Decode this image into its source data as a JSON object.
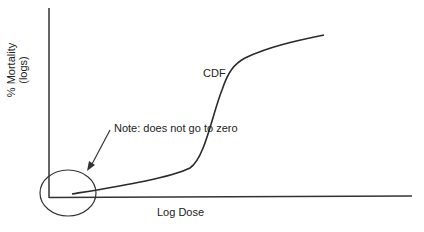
{
  "diagram": {
    "y_axis_label_line1": "% Mortality",
    "y_axis_label_line2": "(logs)",
    "x_axis_label": "Log Dose",
    "curve_label": "CDF",
    "note": "Note: does not go to zero",
    "colors": {
      "line": "#2a2a2a",
      "text": "#222222",
      "background": "#ffffff"
    }
  }
}
